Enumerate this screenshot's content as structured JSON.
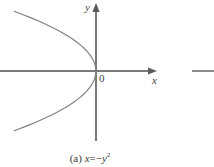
{
  "figure": {
    "caption_prefix": "(a)",
    "caption_lhs": "x",
    "caption_equals": "=",
    "caption_minus": "−",
    "caption_rhs_base": "y",
    "caption_rhs_exponent": "2",
    "caption_full": "(a) x = −y²",
    "origin_label": "0",
    "x_axis_label": "x",
    "y_axis_label": "y",
    "curve_color": "#808080",
    "axis_color": "#7a7a7a",
    "text_color": "#3a3a3a",
    "background_color": "#ffffff"
  },
  "chart_data": {
    "type": "line",
    "equation": "x = -y^2",
    "xlabel": "x",
    "ylabel": "y",
    "grid": false,
    "legend": false,
    "origin": {
      "x": 0,
      "y": 0,
      "label": "0"
    },
    "axes": {
      "x_axis": {
        "label": "x",
        "arrow": "right",
        "pixel_y": 71,
        "pixel_x_start": 0,
        "pixel_x_end": 157
      },
      "y_axis": {
        "label": "y",
        "arrow": "up",
        "pixel_x": 96,
        "pixel_y_start": 3,
        "pixel_y_end": 141
      }
    },
    "xlim": [
      -5.4,
      2.8
    ],
    "ylim": [
      -2.33,
      2.33
    ],
    "series": [
      {
        "name": "x = -y^2",
        "opens": "left",
        "vertex": [
          0,
          0
        ],
        "points": [
          [
            -5.29,
            2.3
          ],
          [
            -4.62,
            2.15
          ],
          [
            -4.0,
            2.0
          ],
          [
            -3.42,
            1.85
          ],
          [
            -2.89,
            1.7
          ],
          [
            -2.4,
            1.55
          ],
          [
            -1.96,
            1.4
          ],
          [
            -1.56,
            1.25
          ],
          [
            -1.21,
            1.1
          ],
          [
            -0.9,
            0.95
          ],
          [
            -0.64,
            0.8
          ],
          [
            -0.42,
            0.65
          ],
          [
            -0.25,
            0.5
          ],
          [
            -0.12,
            0.35
          ],
          [
            -0.04,
            0.2
          ],
          [
            0.0,
            0.0
          ],
          [
            -0.04,
            -0.2
          ],
          [
            -0.12,
            -0.35
          ],
          [
            -0.25,
            -0.5
          ],
          [
            -0.42,
            -0.65
          ],
          [
            -0.64,
            -0.8
          ],
          [
            -0.9,
            -0.95
          ],
          [
            -1.21,
            -1.1
          ],
          [
            -1.56,
            -1.25
          ],
          [
            -1.96,
            -1.4
          ],
          [
            -2.4,
            -1.55
          ],
          [
            -2.89,
            -1.7
          ],
          [
            -3.42,
            -1.85
          ],
          [
            -4.0,
            -2.0
          ],
          [
            -4.62,
            -2.15
          ],
          [
            -5.29,
            -2.3
          ]
        ]
      }
    ],
    "adjacent_figure_fragment": {
      "description": "cut-off horizontal axis line of neighboring figure at right edge",
      "pixel_y": 71,
      "pixel_x_start": 192,
      "pixel_x_end": 214
    }
  }
}
